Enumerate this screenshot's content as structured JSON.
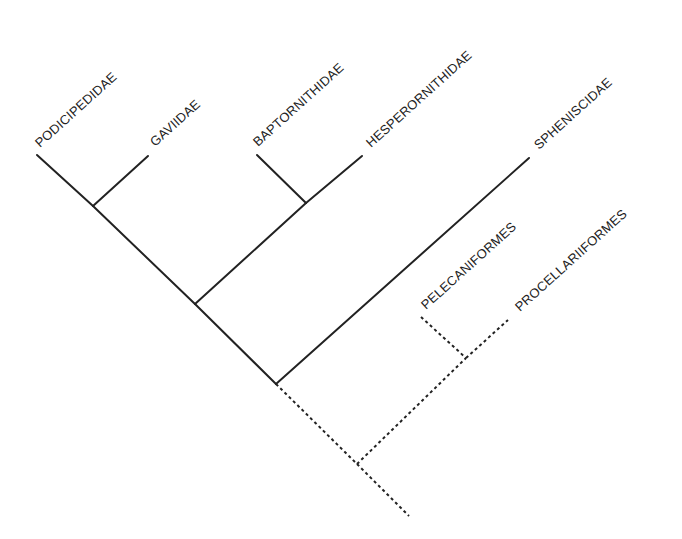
{
  "diagram": {
    "type": "cladogram",
    "taxa": [
      {
        "id": "podicipedidae",
        "label": "PODICIPEDIDAE",
        "x": 40,
        "y": 148,
        "style": "solid"
      },
      {
        "id": "gaviidae",
        "label": "GAVIIDAE",
        "x": 154,
        "y": 148,
        "style": "solid"
      },
      {
        "id": "baptornithidae",
        "label": "BAPTORNITHIDAE",
        "x": 258,
        "y": 148,
        "style": "solid"
      },
      {
        "id": "hesperornithidae",
        "label": "HESPERORNITHIDAE",
        "x": 370,
        "y": 148,
        "style": "solid"
      },
      {
        "id": "spheniscidae",
        "label": "SPHENISCIDAE",
        "x": 538,
        "y": 150,
        "style": "solid"
      },
      {
        "id": "pelecaniformes",
        "label": "PELECANIFORMES",
        "x": 426,
        "y": 310,
        "style": "dotted"
      },
      {
        "id": "procellariiformes",
        "label": "PROCELLARIIFORMES",
        "x": 519,
        "y": 313,
        "style": "dotted"
      }
    ],
    "colors": {
      "line": "#222222",
      "text": "#222222",
      "background": "#ffffff"
    }
  }
}
